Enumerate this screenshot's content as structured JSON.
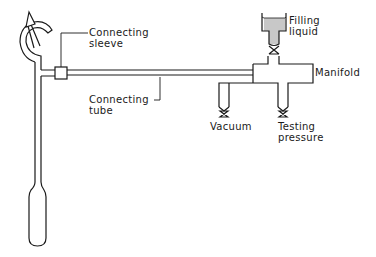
{
  "diagram": {
    "type": "apparatus-schematic",
    "stroke_color": "#1a1a1a",
    "fill_liquid_color": "#c8c8c8",
    "labels": {
      "connecting_sleeve": [
        "Connecting",
        "sleeve"
      ],
      "connecting_tube": [
        "Connecting",
        "tube"
      ],
      "filling_liquid": [
        "Filling",
        "liquid"
      ],
      "manifold": "Manifold",
      "vacuum": "Vacuum",
      "testing_pressure": [
        "Testing",
        "pressure"
      ]
    },
    "components": [
      "ampoule-tube",
      "break-seal-hook",
      "connecting-sleeve",
      "connecting-tube",
      "manifold",
      "filling-funnel",
      "vacuum-valve",
      "testing-pressure-valve",
      "filling-valve"
    ]
  }
}
